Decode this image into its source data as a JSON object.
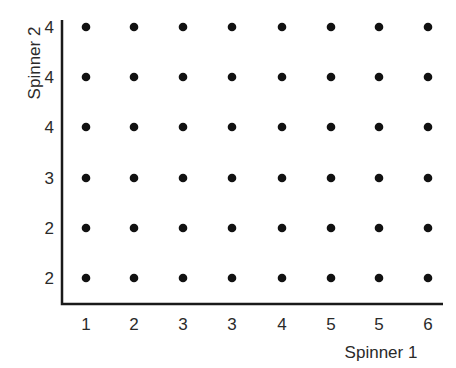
{
  "chart_data": {
    "type": "scatter",
    "title": "",
    "xlabel": "Spinner 1",
    "ylabel": "Spinner 2",
    "x_tick_labels": [
      "1",
      "2",
      "3",
      "3",
      "4",
      "5",
      "5",
      "6"
    ],
    "y_tick_labels_bottom_to_top": [
      "2",
      "2",
      "3",
      "4",
      "4",
      "4"
    ],
    "grid": false,
    "legend": null,
    "columns": 8,
    "rows": 6,
    "points_per_cell": 1
  },
  "style": {
    "dot_color": "#111111",
    "axis_color": "#1a1a1a",
    "text_color": "#2a2a2a"
  }
}
